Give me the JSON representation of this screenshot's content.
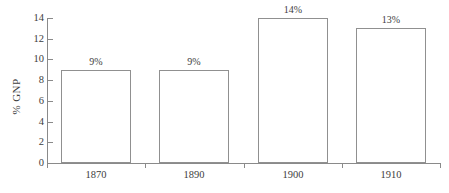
{
  "chart_data": {
    "type": "bar",
    "title": "",
    "subtitle": "",
    "xlabel": "",
    "ylabel": "% GNP",
    "categories": [
      "1870",
      "1890",
      "1900",
      "1910"
    ],
    "values": [
      9,
      9,
      14,
      13
    ],
    "data_labels": [
      "9%",
      "9%",
      "14%",
      "13%"
    ],
    "ylim": [
      0,
      14
    ],
    "y_ticks": [
      0,
      2,
      4,
      6,
      8,
      10,
      12,
      14
    ],
    "y_tick_labels": [
      "0",
      "2",
      "4",
      "6",
      "8",
      "10",
      "12",
      "14"
    ],
    "grid": false,
    "legend": null,
    "legend_position": "none",
    "series": [
      {
        "name": "% GNP",
        "values": [
          9,
          9,
          14,
          13
        ]
      }
    ],
    "colors": {
      "bar_fill": "#ffffff",
      "bar_outline": "#909090",
      "axis": "#8a8a8a",
      "text": "#3d3d3d",
      "background": "#ffffff"
    }
  }
}
